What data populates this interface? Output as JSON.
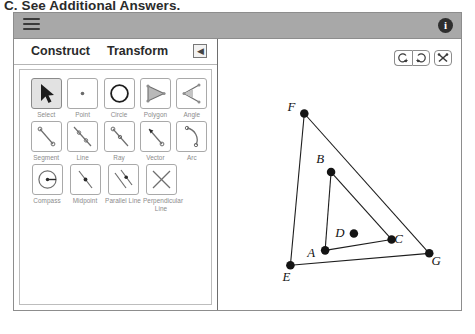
{
  "caption": "C. See Additional Answers.",
  "header": {
    "menu_icon": "hamburger-icon",
    "info_icon": "info-icon",
    "info_label": "i"
  },
  "left_panel": {
    "tabs": [
      {
        "label": "Construct",
        "selected": true
      },
      {
        "label": "Transform",
        "selected": false
      }
    ],
    "collapse_label": "◀",
    "tool_rows": [
      [
        {
          "label": "Select",
          "icon": "cursor-arrow-icon",
          "selected": true
        },
        {
          "label": "Point",
          "icon": "point-icon",
          "selected": false
        },
        {
          "label": "Circle",
          "icon": "circle-icon",
          "selected": false
        },
        {
          "label": "Polygon",
          "icon": "polygon-icon",
          "selected": false
        },
        {
          "label": "Angle",
          "icon": "angle-icon",
          "selected": false
        }
      ],
      [
        {
          "label": "Segment",
          "icon": "segment-icon",
          "selected": false
        },
        {
          "label": "Line",
          "icon": "line-icon",
          "selected": false
        },
        {
          "label": "Ray",
          "icon": "ray-icon",
          "selected": false
        },
        {
          "label": "Vector",
          "icon": "vector-icon",
          "selected": false
        },
        {
          "label": "Arc",
          "icon": "arc-icon",
          "selected": false
        }
      ],
      [
        {
          "label": "Compass",
          "icon": "compass-icon",
          "selected": false
        },
        {
          "label": "Midpoint",
          "icon": "midpoint-icon",
          "selected": false
        },
        {
          "label": "Parallel Line",
          "icon": "parallel-line-icon",
          "selected": false
        },
        {
          "label": "Perpendicular Line",
          "icon": "perpendicular-line-icon",
          "selected": false
        }
      ]
    ]
  },
  "canvas": {
    "toolbar": [
      {
        "name": "undo-button",
        "icon": "undo-arrow-icon"
      },
      {
        "name": "redo-button",
        "icon": "redo-arrow-icon"
      },
      {
        "name": "tools-button",
        "icon": "crossed-tools-icon"
      }
    ],
    "figure": {
      "description": "Two nested triangles ABC and EFG with free point D",
      "points": [
        {
          "id": "F",
          "label": "F",
          "x": 86,
          "y": 74,
          "label_dx": -13,
          "label_dy": -3
        },
        {
          "id": "B",
          "label": "B",
          "x": 113,
          "y": 133,
          "label_dx": -11,
          "label_dy": -9
        },
        {
          "id": "E",
          "label": "E",
          "x": 72,
          "y": 227,
          "label_dx": -4,
          "label_dy": 16
        },
        {
          "id": "A",
          "label": "A",
          "x": 107,
          "y": 212,
          "label_dx": -14,
          "label_dy": 7
        },
        {
          "id": "D",
          "label": "D",
          "x": 136,
          "y": 195,
          "label_dx": -14,
          "label_dy": 4
        },
        {
          "id": "C",
          "label": "C",
          "x": 174,
          "y": 201,
          "label_dx": 7,
          "label_dy": 4
        },
        {
          "id": "G",
          "label": "G",
          "x": 212,
          "y": 215,
          "label_dx": 7,
          "label_dy": 12
        }
      ],
      "segments": [
        {
          "from": "A",
          "to": "B"
        },
        {
          "from": "B",
          "to": "C"
        },
        {
          "from": "C",
          "to": "A"
        },
        {
          "from": "E",
          "to": "F"
        },
        {
          "from": "F",
          "to": "G"
        },
        {
          "from": "G",
          "to": "E"
        }
      ],
      "free_points": [
        "D"
      ],
      "point_radius": 4.3
    }
  },
  "colors": {
    "header_bar": "#a8a8a8",
    "window_border": "#8d8d8d",
    "tool_border": "#a9a9a9",
    "tool_selected": "#e2e2e2",
    "tool_label": "#8b8b8b",
    "geometry_stroke": "#1d1d1d",
    "caption_text": "#2b2b2b"
  }
}
